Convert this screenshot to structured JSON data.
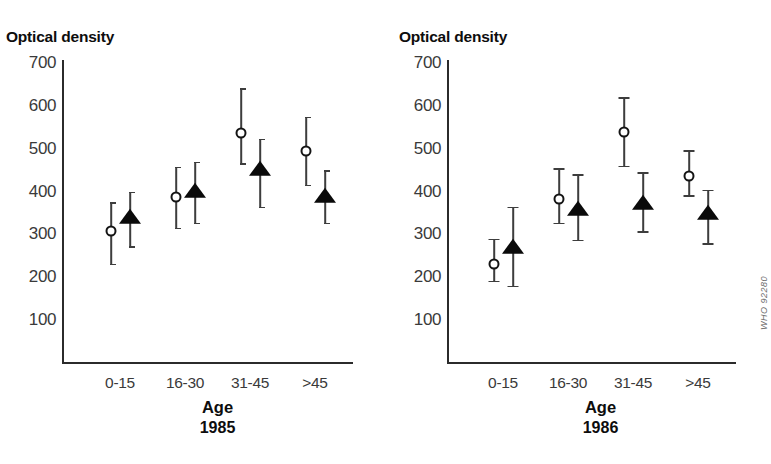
{
  "figure": {
    "credit": "WHO 92280"
  },
  "chart_data": [
    {
      "type": "scatter",
      "title": "Optical density",
      "xlabel": "Age",
      "sublabel": "1985",
      "ylabel": "Optical density",
      "categories": [
        "0-15",
        "16-30",
        "31-45",
        ">45"
      ],
      "ylim": [
        0,
        700
      ],
      "yticks": [
        700,
        600,
        500,
        400,
        300,
        200,
        100
      ],
      "grid": false,
      "legend": "none",
      "errorbar_cap_style": "bracket",
      "series": [
        {
          "name": "open-circle",
          "marker": "open-circle",
          "values": [
            308,
            388,
            537,
            494
          ],
          "err_low": [
            232,
            316,
            466,
            416
          ],
          "err_high": [
            375,
            458,
            641,
            575
          ]
        },
        {
          "name": "filled-triangle",
          "marker": "filled-triangle",
          "values": [
            338,
            400,
            450,
            387
          ],
          "err_low": [
            272,
            327,
            365,
            327
          ],
          "err_high": [
            400,
            470,
            523,
            450
          ]
        }
      ]
    },
    {
      "type": "scatter",
      "title": "Optical density",
      "xlabel": "Age",
      "sublabel": "1986",
      "ylabel": "Optical density",
      "categories": [
        "0-15",
        "16-30",
        "31-45",
        ">45"
      ],
      "ylim": [
        0,
        700
      ],
      "yticks": [
        700,
        600,
        500,
        400,
        300,
        200,
        100
      ],
      "grid": false,
      "legend": "none",
      "errorbar_cap_style": "tee",
      "series": [
        {
          "name": "open-circle",
          "marker": "open-circle",
          "values": [
            232,
            383,
            538,
            437
          ],
          "err_low": [
            192,
            327,
            460,
            392
          ],
          "err_high": [
            290,
            455,
            620,
            497
          ]
        },
        {
          "name": "filled-triangle",
          "marker": "filled-triangle",
          "values": [
            268,
            357,
            372,
            348
          ],
          "err_low": [
            180,
            288,
            308,
            280
          ],
          "err_high": [
            365,
            440,
            445,
            404
          ]
        }
      ]
    }
  ]
}
